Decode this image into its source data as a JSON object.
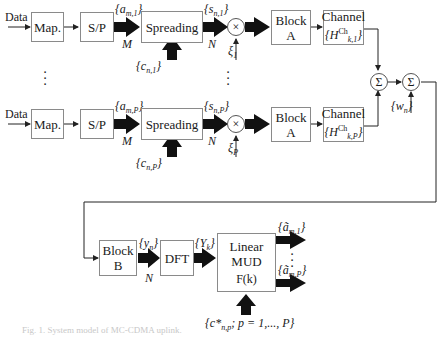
{
  "diagram": {
    "type": "block-diagram",
    "branch1": {
      "input_label": "Data",
      "map_label": "Map.",
      "sp_label": "S/P",
      "sp_out_symbol": "{a",
      "sp_out_sub": "m,1",
      "sp_out_size": "M",
      "spreading_label": "Spreading",
      "code_symbol": "{c",
      "code_sub": "n,1",
      "spread_out_symbol": "{s",
      "spread_out_sub": "n,1",
      "spread_out_size": "N",
      "mult_symbol": "×",
      "xi_symbol": "ξ",
      "xi_sub": "1",
      "blockA_line1": "Block",
      "blockA_line2": "A",
      "channel_line1": "Channel",
      "channel_H": "{H",
      "channel_sup": "Ch",
      "channel_sub": "k,1"
    },
    "branchP": {
      "input_label": "Data",
      "map_label": "Map.",
      "sp_label": "S/P",
      "sp_out_symbol": "{a",
      "sp_out_sub": "m,P",
      "sp_out_size": "M",
      "spreading_label": "Spreading",
      "code_symbol": "{c",
      "code_sub": "n,P",
      "spread_out_symbol": "{s",
      "spread_out_sub": "n,P",
      "spread_out_size": "N",
      "mult_symbol": "×",
      "xi_symbol": "ξ",
      "xi_sub": "P",
      "blockA_line1": "Block",
      "blockA_line2": "A",
      "channel_line1": "Channel",
      "channel_H": "{H",
      "channel_sup": "Ch",
      "channel_sub": "k,P"
    },
    "sum1_symbol": "Σ",
    "sum2_symbol": "Σ",
    "noise_symbol": "{w",
    "noise_sub": "n",
    "receiver": {
      "blockB_line1": "Block",
      "blockB_line2": "B",
      "y_symbol": "{y",
      "y_sub": "n",
      "y_size": "N",
      "dft_label": "DFT",
      "Y_symbol": "{Y",
      "Y_sub": "k",
      "mud_line1": "Linear",
      "mud_line2": "MUD",
      "mud_line3": "F(k)",
      "out1_symbol": "{ã",
      "out1_sub": "m,1",
      "outP_symbol": "{ã",
      "outP_sub": "m,P",
      "codes_label": "{c*",
      "codes_sub": "n,p",
      "codes_rest": "; p = 1,..., P}"
    },
    "close_brace": "}",
    "caption": "Fig. 1. System model of MC-CDMA uplink."
  }
}
